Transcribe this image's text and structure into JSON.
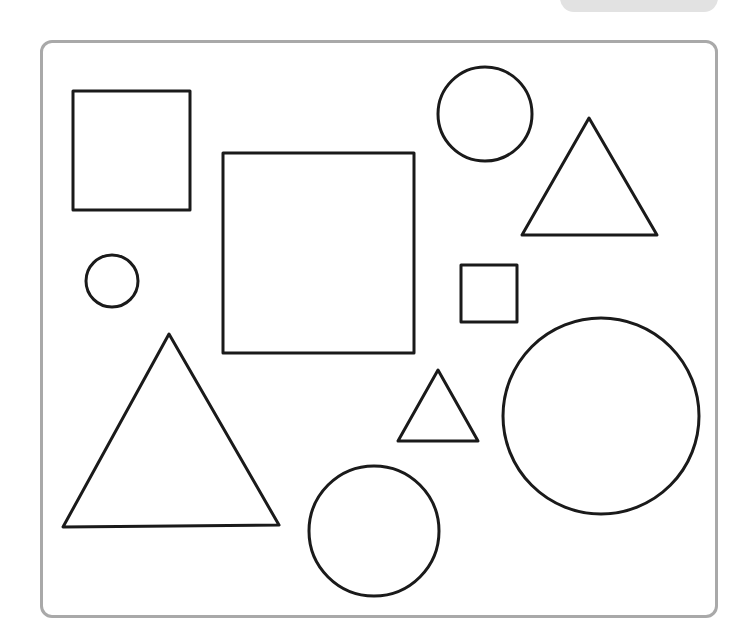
{
  "worksheet": {
    "frame_color": "#a9a9a9",
    "stroke_color": "#1a1a1a",
    "shapes": [
      {
        "type": "square",
        "label": "small-square-top-left"
      },
      {
        "type": "square",
        "label": "large-square-center"
      },
      {
        "type": "square",
        "label": "tiny-square"
      },
      {
        "type": "circle",
        "label": "circle-top"
      },
      {
        "type": "circle",
        "label": "small-circle-left"
      },
      {
        "type": "circle",
        "label": "large-circle-right"
      },
      {
        "type": "circle",
        "label": "circle-bottom"
      },
      {
        "type": "triangle",
        "label": "triangle-top-right"
      },
      {
        "type": "triangle",
        "label": "large-triangle-bottom-left"
      },
      {
        "type": "triangle",
        "label": "small-triangle-center"
      }
    ],
    "counts": {
      "squares": 3,
      "circles": 4,
      "triangles": 3
    }
  }
}
